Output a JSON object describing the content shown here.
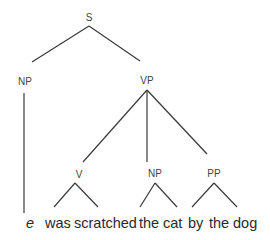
{
  "diagram": {
    "type": "syntax-tree",
    "nodes": {
      "S": {
        "label": "S"
      },
      "NP_subject": {
        "label": "NP"
      },
      "VP": {
        "label": "VP"
      },
      "V": {
        "label": "V"
      },
      "NP_object": {
        "label": "NP"
      },
      "PP": {
        "label": "PP"
      }
    },
    "edges": [
      {
        "from": "S",
        "to": "NP_subject"
      },
      {
        "from": "S",
        "to": "VP"
      },
      {
        "from": "VP",
        "to": "V"
      },
      {
        "from": "VP",
        "to": "NP_object"
      },
      {
        "from": "VP",
        "to": "PP"
      },
      {
        "from": "NP_subject",
        "to": "e",
        "style": "vertical-line"
      },
      {
        "from": "V",
        "to": "was scratched",
        "style": "triangle"
      },
      {
        "from": "NP_object",
        "to": "the cat",
        "style": "triangle"
      },
      {
        "from": "PP",
        "to": "by the dog",
        "style": "triangle"
      }
    ],
    "terminals": {
      "empty": "e",
      "w1": "was",
      "w2": "scratched",
      "w3": "the",
      "w4": "cat",
      "w5": "by",
      "w6": "the",
      "w7": "dog"
    },
    "line_color": "#3a3a3a",
    "label_color": "#444444",
    "text_color": "#2a2a2a"
  }
}
